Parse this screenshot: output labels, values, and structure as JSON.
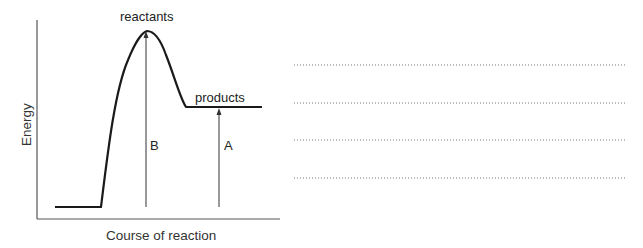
{
  "diagram": {
    "type": "energy-profile",
    "y_axis_label": "Energy",
    "x_axis_label": "Course of reaction",
    "labels": {
      "peak": "reactants",
      "plateau": "products",
      "arrow_b": "B",
      "arrow_a": "A"
    },
    "colors": {
      "curve": "#1a1a1a",
      "axes": "#444444",
      "dotted": "#888888"
    }
  },
  "answer_area": {
    "line_count": 4
  }
}
